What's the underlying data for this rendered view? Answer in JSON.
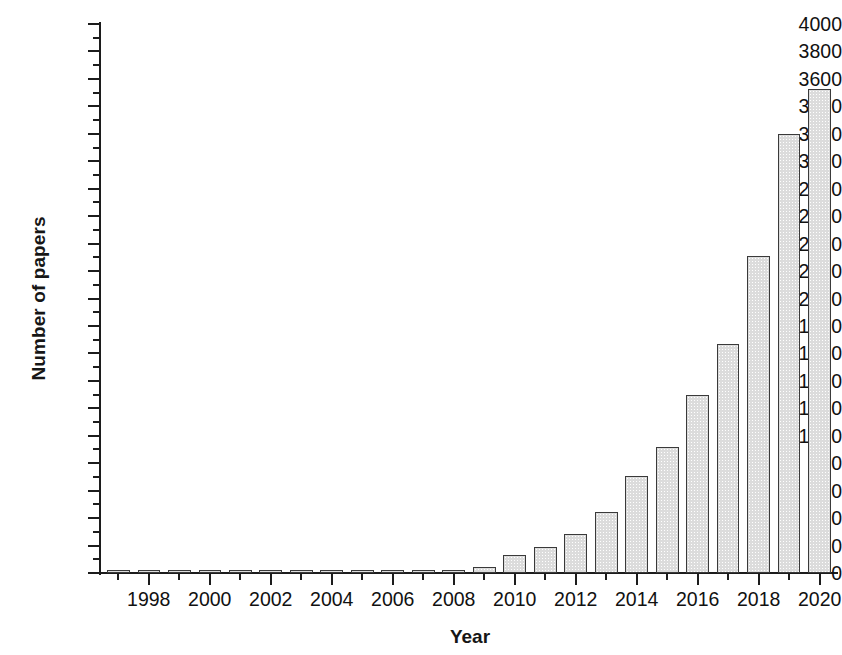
{
  "chart_data": {
    "type": "bar",
    "title": "",
    "xlabel": "Year",
    "ylabel": "Number of papers",
    "categories": [
      1997,
      1998,
      1999,
      2000,
      2001,
      2002,
      2003,
      2004,
      2005,
      2006,
      2007,
      2008,
      2009,
      2010,
      2011,
      2012,
      2013,
      2014,
      2015,
      2016,
      2017,
      2018,
      2019,
      2020
    ],
    "values": [
      4,
      6,
      4,
      5,
      6,
      5,
      7,
      6,
      6,
      6,
      5,
      8,
      45,
      130,
      190,
      285,
      445,
      705,
      920,
      1300,
      1670,
      2310,
      3200,
      3530
    ],
    "xlim": [
      1996.4,
      2020.6
    ],
    "ylim": [
      0,
      4000
    ],
    "ytick_step": 200,
    "yminor_step": 100,
    "ytick_labels": [
      "4000",
      "3800",
      "3600",
      "3400",
      "3200",
      "3000",
      "2800",
      "2600",
      "2400",
      "2200",
      "2000",
      "1800",
      "1600",
      "1400",
      "1200",
      "1000",
      "800",
      "600",
      "400",
      "200",
      "0"
    ],
    "xtick_labels": [
      "1998",
      "2000",
      "2002",
      "2004",
      "2006",
      "2008",
      "2010",
      "2012",
      "2014",
      "2016",
      "2018",
      "2020"
    ],
    "xtick_minor": [
      1997,
      1999,
      2001,
      2003,
      2005,
      2007,
      2009,
      2011,
      2013,
      2015,
      2017,
      2019
    ],
    "grid": false,
    "legend": false,
    "bar_fill_color": "#dcdcdc",
    "bar_edge_color": "#3a3a3a",
    "axis_color": "#1c1c1c",
    "background_color": "#ffffff"
  }
}
